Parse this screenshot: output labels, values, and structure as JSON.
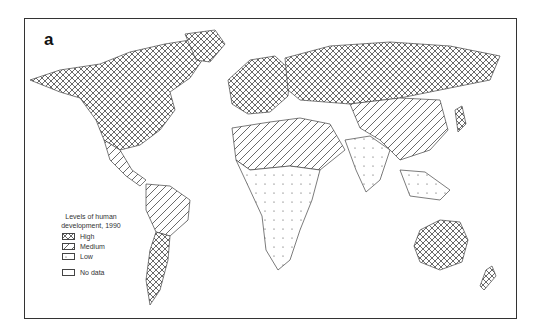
{
  "panel_label": "a",
  "legend": {
    "title_line1": "Levels of human",
    "title_line2": "development, 1990",
    "items": [
      {
        "label": "High",
        "pattern": "crosshatch"
      },
      {
        "label": "Medium",
        "pattern": "diagonal"
      },
      {
        "label": "Low",
        "pattern": "dots"
      },
      {
        "label": "No data",
        "pattern": "blank"
      }
    ]
  },
  "colors": {
    "ink": "#333333",
    "background": "#ffffff"
  }
}
